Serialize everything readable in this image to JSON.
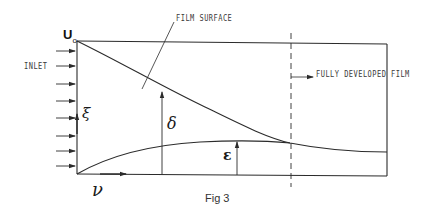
{
  "figure": {
    "caption": "Fig 3",
    "labels": {
      "velocity": "U",
      "velocity_subscript": "o",
      "inlet": "INLET",
      "film_surface": "FILM SURFACE",
      "fully_developed": "FULLY DEVELOPED FILM",
      "xi": "ξ",
      "delta": "δ",
      "epsilon": "ε",
      "nu": "ν"
    },
    "colors": {
      "line": "#2b2b2b",
      "background": "#ffffff"
    }
  }
}
